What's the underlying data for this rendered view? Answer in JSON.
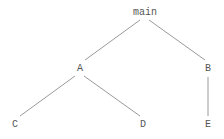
{
  "diagram": {
    "type": "tree",
    "colors": {
      "edge": "#9a9a9a",
      "label": "#555555",
      "background": "#ffffff"
    },
    "nodes": [
      {
        "id": "main",
        "label": "main",
        "x": 145,
        "y": 15
      },
      {
        "id": "A",
        "label": "A",
        "x": 80,
        "y": 71
      },
      {
        "id": "B",
        "label": "B",
        "x": 208,
        "y": 71
      },
      {
        "id": "C",
        "label": "C",
        "x": 15,
        "y": 127
      },
      {
        "id": "D",
        "label": "D",
        "x": 143,
        "y": 127
      },
      {
        "id": "E",
        "label": "E",
        "x": 208,
        "y": 127
      }
    ],
    "edges": [
      {
        "from": "main",
        "to": "A"
      },
      {
        "from": "main",
        "to": "B"
      },
      {
        "from": "A",
        "to": "C"
      },
      {
        "from": "A",
        "to": "D"
      },
      {
        "from": "B",
        "to": "E"
      }
    ]
  }
}
